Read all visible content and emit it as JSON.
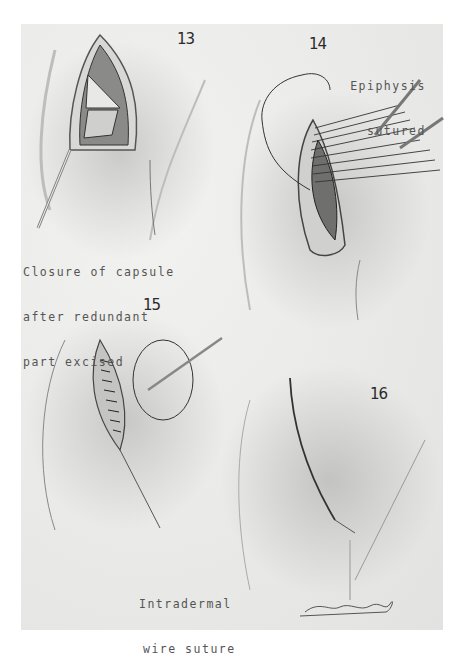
{
  "plate": {
    "panels": [
      {
        "number": "13",
        "caption_lines": [
          "Closure of capsule",
          "after redundant",
          "part excised"
        ]
      },
      {
        "number": "14",
        "caption_lines": [
          "Epiphysis",
          "sutured"
        ]
      },
      {
        "number": "15",
        "caption_lines": [
          "Intradermal",
          "wire suture"
        ]
      },
      {
        "number": "16",
        "caption_lines": []
      }
    ],
    "signature": "Drummond"
  }
}
